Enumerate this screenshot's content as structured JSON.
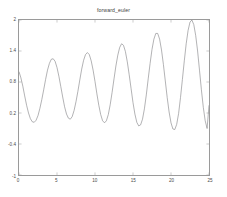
{
  "figure": {
    "title": "forward_euler",
    "background_color": "#ffffff",
    "axis_color": "#9a9a9a",
    "line_color": "#7d7d82",
    "tick_label_color": "#4a4a4a"
  },
  "chart_data": {
    "type": "line",
    "title": "forward_euler",
    "xlabel": "",
    "ylabel": "",
    "xlim": [
      0,
      25
    ],
    "ylim": [
      -1,
      2
    ],
    "grid": false,
    "legend": null,
    "xticks": [
      0,
      5,
      10,
      15,
      20,
      25
    ],
    "xtick_labels": [
      "0",
      "5",
      "10",
      "15",
      "20",
      "25"
    ],
    "yticks": [
      -1,
      -0.4,
      0.2,
      0.8,
      1.4,
      2
    ],
    "ytick_labels": [
      "2",
      "1.4",
      "0.8",
      "0.2",
      "-0.4",
      "-1"
    ],
    "series": [
      {
        "name": "forward_euler",
        "color": "#7d7d82",
        "x": [
          0.0,
          0.25,
          0.5,
          0.75,
          1.0,
          1.25,
          1.5,
          1.75,
          2.0,
          2.25,
          2.5,
          2.75,
          3.0,
          3.25,
          3.5,
          3.75,
          4.0,
          4.25,
          4.5,
          4.75,
          5.0,
          5.25,
          5.5,
          5.75,
          6.0,
          6.25,
          6.5,
          6.75,
          7.0,
          7.25,
          7.5,
          7.75,
          8.0,
          8.25,
          8.5,
          8.75,
          9.0,
          9.25,
          9.5,
          9.75,
          10.0,
          10.25,
          10.5,
          10.75,
          11.0,
          11.25,
          11.5,
          11.75,
          12.0,
          12.25,
          12.5,
          12.75,
          13.0,
          13.25,
          13.5,
          13.75,
          14.0,
          14.25,
          14.5,
          14.75,
          15.0,
          15.25,
          15.5,
          15.75,
          16.0,
          16.25,
          16.5,
          16.75,
          17.0,
          17.25,
          17.5,
          17.75,
          18.0,
          18.25,
          18.5,
          18.75,
          19.0,
          19.25,
          19.5,
          19.75,
          20.0,
          20.25,
          20.5,
          20.75,
          21.0,
          21.25,
          21.5,
          21.75,
          22.0,
          22.25,
          22.5,
          22.75,
          23.0,
          23.25,
          23.5,
          23.75,
          24.0,
          24.25,
          24.5,
          24.75,
          25.0
        ],
        "y": [
          1.0,
          0.88,
          0.72,
          0.53,
          0.35,
          0.2,
          0.09,
          0.03,
          0.02,
          0.06,
          0.15,
          0.29,
          0.46,
          0.65,
          0.85,
          1.03,
          1.16,
          1.24,
          1.25,
          1.2,
          1.08,
          0.91,
          0.71,
          0.51,
          0.32,
          0.18,
          0.1,
          0.08,
          0.13,
          0.25,
          0.42,
          0.62,
          0.84,
          1.05,
          1.22,
          1.33,
          1.37,
          1.33,
          1.21,
          1.03,
          0.81,
          0.57,
          0.35,
          0.17,
          0.05,
          0.01,
          0.05,
          0.17,
          0.36,
          0.6,
          0.86,
          1.11,
          1.32,
          1.47,
          1.54,
          1.51,
          1.39,
          1.19,
          0.94,
          0.67,
          0.4,
          0.18,
          0.02,
          -0.05,
          -0.03,
          0.08,
          0.28,
          0.55,
          0.86,
          1.16,
          1.43,
          1.63,
          1.74,
          1.74,
          1.63,
          1.42,
          1.14,
          0.82,
          0.5,
          0.22,
          0.01,
          -0.11,
          -0.12,
          -0.02,
          0.19,
          0.5,
          0.85,
          1.21,
          1.54,
          1.8,
          1.96,
          2.0,
          1.91,
          1.7,
          1.4,
          1.03,
          0.65,
          0.31,
          0.05,
          -0.1,
          0.35
        ]
      }
    ]
  }
}
